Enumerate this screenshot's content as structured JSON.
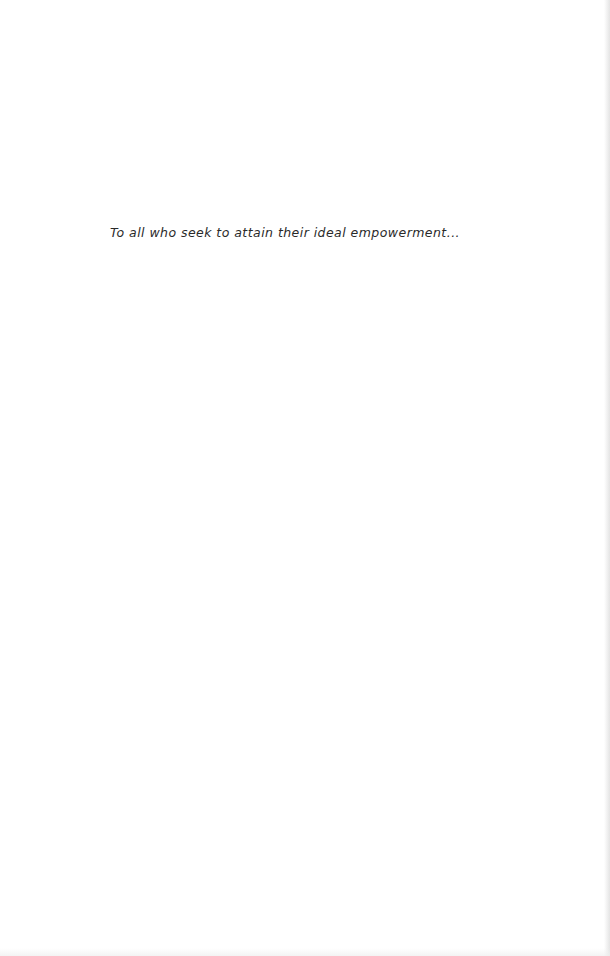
{
  "page": {
    "dedication": "To all who seek to attain their ideal empowerment..."
  }
}
